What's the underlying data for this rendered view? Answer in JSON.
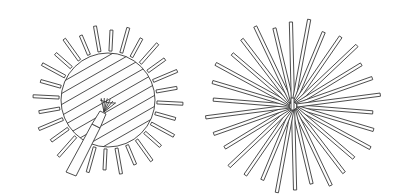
{
  "figures": [
    {
      "id": "left",
      "description": "Circular disc with diagonal hatching, a small fan/brush shape and a handle, surrounded by radial spokes",
      "spoke_count": 28
    },
    {
      "id": "right",
      "description": "Starburst of long thin strips radiating from a center point",
      "spoke_count": 30
    }
  ],
  "colors": {
    "ink": "#3a3a3a",
    "background": "#ffffff"
  }
}
